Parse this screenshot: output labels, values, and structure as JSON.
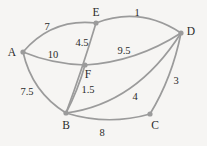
{
  "figure": {
    "kind": "weighted-undirected-graph",
    "background_color": "#f6f5f3",
    "edge_color": "#9b9b9b",
    "node_color": "#9b9b9b",
    "text_color": "#2b2b2b"
  },
  "nodes": [
    {
      "id": "A",
      "label": "A",
      "x": 23,
      "y": 52,
      "label_x": 12,
      "label_y": 53
    },
    {
      "id": "B",
      "label": "B",
      "x": 66,
      "y": 113,
      "label_x": 66,
      "label_y": 126
    },
    {
      "id": "C",
      "label": "C",
      "x": 150,
      "y": 114,
      "label_x": 155,
      "label_y": 126
    },
    {
      "id": "D",
      "label": "D",
      "x": 181,
      "y": 33,
      "label_x": 191,
      "label_y": 32
    },
    {
      "id": "E",
      "label": "E",
      "x": 96,
      "y": 23,
      "label_x": 96,
      "label_y": 13
    },
    {
      "id": "F",
      "label": "F",
      "x": 85,
      "y": 65,
      "label_x": 88,
      "label_y": 75
    }
  ],
  "edges": [
    {
      "id": "A-E",
      "from": "A",
      "to": "E",
      "weight": "7",
      "label_x": 47,
      "label_y": 27
    },
    {
      "id": "A-F",
      "from": "A",
      "to": "F",
      "weight": "10",
      "label_x": 53,
      "label_y": 55
    },
    {
      "id": "A-B",
      "from": "A",
      "to": "B",
      "weight": "7.5",
      "label_x": 27,
      "label_y": 92
    },
    {
      "id": "E-D",
      "from": "E",
      "to": "D",
      "weight": "1",
      "label_x": 137,
      "label_y": 13
    },
    {
      "id": "E-B",
      "from": "E",
      "to": "B",
      "weight": "4.5",
      "label_x": 82,
      "label_y": 43
    },
    {
      "id": "F-D",
      "from": "F",
      "to": "D",
      "weight": "9.5",
      "label_x": 124,
      "label_y": 51
    },
    {
      "id": "F-B",
      "from": "F",
      "to": "B",
      "weight": "1.5",
      "label_x": 88,
      "label_y": 90
    },
    {
      "id": "B-D",
      "from": "B",
      "to": "D",
      "weight": "4",
      "label_x": 135,
      "label_y": 97
    },
    {
      "id": "B-C",
      "from": "B",
      "to": "C",
      "weight": "8",
      "label_x": 102,
      "label_y": 133
    },
    {
      "id": "C-D",
      "from": "C",
      "to": "D",
      "weight": "3",
      "label_x": 176,
      "label_y": 81
    }
  ]
}
